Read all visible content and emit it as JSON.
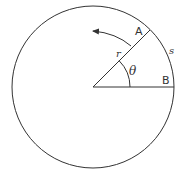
{
  "diagram": {
    "type": "circle-arc-radian",
    "colors": {
      "stroke": "#333333",
      "background": "#ffffff"
    },
    "circle": {
      "cx": 93,
      "cy": 87,
      "r": 81
    },
    "labels": {
      "point_a": "A",
      "point_b": "B",
      "radius": "r",
      "angle": "θ",
      "arc_length": "s"
    },
    "elements": {
      "radius_line": "line from center to point A at 45°",
      "base_line": "line from center to point B",
      "angle_arc": "arc marking angle θ",
      "direction_arrow": "curved arrow indicating counter-clockwise rotation"
    }
  }
}
